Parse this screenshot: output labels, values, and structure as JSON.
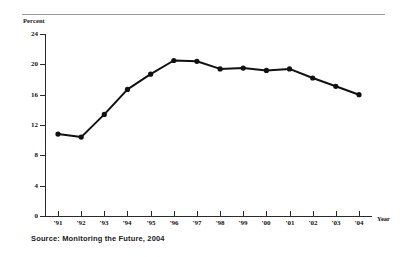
{
  "figure": {
    "y_axis_title": "Percent",
    "x_axis_title": "Year",
    "source_note": "Source: Monitoring the Future, 2004",
    "line_color": "#111111",
    "marker_color": "#111111",
    "rule_color": "#9a9a9a"
  },
  "chart_data": {
    "type": "line",
    "title": "",
    "subtitle": "",
    "xlabel": "Year",
    "ylabel": "Percent",
    "categories": [
      "'91",
      "'92",
      "'93",
      "'94",
      "'95",
      "'96",
      "'97",
      "'98",
      "'99",
      "'00",
      "'01",
      "'02",
      "'03",
      "'04"
    ],
    "values": [
      10.8,
      10.4,
      13.4,
      16.7,
      18.7,
      20.5,
      20.4,
      19.4,
      19.5,
      19.2,
      19.4,
      18.2,
      17.1,
      16.0
    ],
    "series": [
      {
        "name": "Percent",
        "values": [
          10.8,
          10.4,
          13.4,
          16.7,
          18.7,
          20.5,
          20.4,
          19.4,
          19.5,
          19.2,
          19.4,
          18.2,
          17.1,
          16.0
        ]
      }
    ],
    "ylim": [
      0,
      24
    ],
    "yticks": [
      0,
      4,
      8,
      12,
      16,
      20,
      24
    ],
    "ytick_labels": [
      "0",
      "4",
      "8",
      "12",
      "16",
      "20",
      "24"
    ],
    "xtick_labels": [
      "'91",
      "'92",
      "'93",
      "'94",
      "'95",
      "'96",
      "'97",
      "'98",
      "'99",
      "'00",
      "'01",
      "'02",
      "'03",
      "'04"
    ],
    "grid": false,
    "legend": "none",
    "markers": "filled-circle",
    "annotations": [
      "Source: Monitoring the Future, 2004"
    ]
  }
}
